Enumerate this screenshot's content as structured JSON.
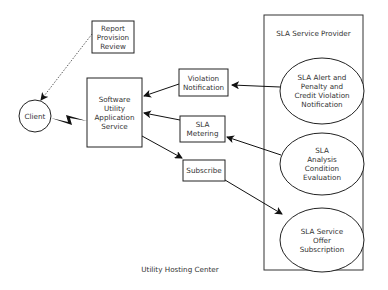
{
  "diagram": {
    "container_title": "SLA Service Provider",
    "footer_label": "Utility Hosting Center",
    "nodes": {
      "client": "Client",
      "report": "Report\nProvision\nReview",
      "software": "Software\nUtility\nApplication\nService",
      "violation": "Violation\nNotification",
      "metering": "SLA\nMetering",
      "subscribe": "Subscribe",
      "alert": "SLA Alert and\nPenalty and\nCredit Violation\nNotification",
      "analysis": "SLA\nAnalysis\nCondition\nEvaluation",
      "offer": "SLA Service\nOffer\nSubscription"
    },
    "edges": [
      {
        "from": "report",
        "to": "client",
        "style": "dotted"
      },
      {
        "from": "software",
        "to": "client",
        "style": "lightning"
      },
      {
        "from": "violation",
        "to": "software",
        "style": "arrow"
      },
      {
        "from": "metering",
        "to": "software",
        "style": "arrow"
      },
      {
        "from": "software",
        "to": "subscribe",
        "style": "arrow"
      },
      {
        "from": "alert",
        "to": "violation",
        "style": "arrow"
      },
      {
        "from": "analysis",
        "to": "metering",
        "style": "arrow"
      },
      {
        "from": "subscribe",
        "to": "offer",
        "style": "arrow"
      }
    ]
  }
}
